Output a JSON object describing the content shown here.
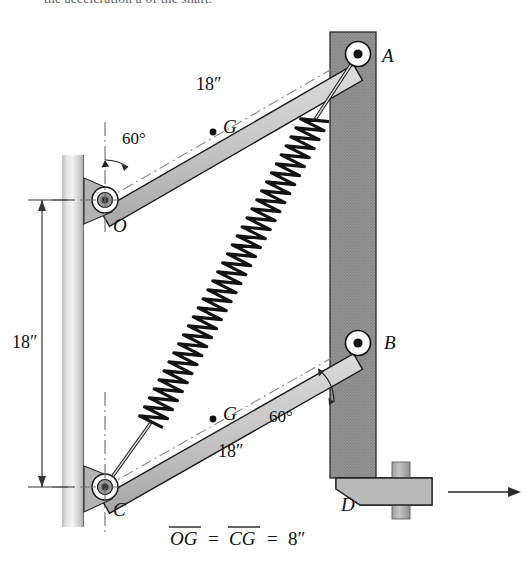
{
  "figure": {
    "title_fragment": "the acceleration a of the shaft.",
    "caption": "OG = CG = 8″",
    "caption_parts": {
      "og": "OG",
      "eq1": "=",
      "cg": "CG",
      "eq2": "=",
      "value": "8″"
    },
    "labels": {
      "pivot_a": "A",
      "pivot_b": "B",
      "pivot_o": "O",
      "pivot_c": "C",
      "point_d": "D",
      "cg_top": "G",
      "cg_bottom": "G",
      "bar_top_length": "18″",
      "bar_bottom_length": "18″",
      "wall_separation": "18″",
      "angle_top": "60°",
      "angle_bottom": "60°"
    },
    "colors": {
      "bar_fill": "#c9c9c9",
      "bar_edge": "#1a1a1a",
      "right_wall_fill": "#8e8e8e",
      "left_wall_fill": "#d2d2d2",
      "spring_stroke": "#141414",
      "centerline": "#7c7c7c",
      "text": "#101014",
      "hub_center": "#3a3a3a"
    },
    "geometry": {
      "pivot_a": {
        "x": 358,
        "y": 54
      },
      "pivot_b": {
        "x": 358,
        "y": 343
      },
      "pivot_o": {
        "x": 105,
        "y": 200
      },
      "pivot_c": {
        "x": 105,
        "y": 487
      },
      "bar_half_width": 11,
      "hub_outer_radius": 13,
      "hub_inner_radius": 5.5,
      "hub_dot_radius": 3,
      "spring_turns": 34,
      "spring_amplitude": 13,
      "left_wall": {
        "x": 62,
        "y": 155,
        "width": 22,
        "height": 370
      },
      "right_wall": {
        "x": 330,
        "y": 32,
        "width": 46,
        "height": 446
      },
      "dimension_line_x": 42,
      "dimension_top_y": 200,
      "dimension_bottom_y": 487,
      "arrow": {
        "x1": 448,
        "y1": 492,
        "x2": 520,
        "y2": 492
      }
    }
  }
}
